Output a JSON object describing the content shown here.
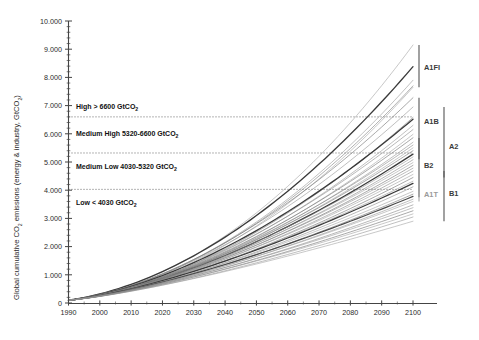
{
  "chart_data": {
    "type": "line",
    "title": "",
    "xlabel": "",
    "ylabel": "Global cumulative CO2 emissions (energy & industry, GtCO2)",
    "ylabel_parts": {
      "pre": "Global cumulative CO",
      "sub1": "2",
      "mid": " emissions (energy & industry, GtCO",
      "sub2": "2",
      "post": ")"
    },
    "xlim": [
      1990,
      2100
    ],
    "ylim": [
      0,
      10000
    ],
    "x_ticks": [
      1990,
      2000,
      2010,
      2020,
      2030,
      2040,
      2050,
      2060,
      2070,
      2080,
      2090,
      2100
    ],
    "x_tick_labels": [
      "1990",
      "2000",
      "2010",
      "2020",
      "2030",
      "2040",
      "2050",
      "2060",
      "2070",
      "2080",
      "2090",
      "2100"
    ],
    "y_ticks": [
      0,
      1000,
      2000,
      3000,
      4000,
      5000,
      6000,
      7000,
      8000,
      9000,
      10000
    ],
    "y_tick_labels": [
      "0",
      "1.000",
      "2.000",
      "3.000",
      "4.000",
      "5.000",
      "6.000",
      "7.000",
      "8.000",
      "9.000",
      "10.000"
    ],
    "y_minor_tick_step": 200,
    "grid": false,
    "legend": "right-brackets",
    "threshold_lines": [
      {
        "value": 6600,
        "style": "dotted"
      },
      {
        "value": 5320,
        "style": "dotted"
      },
      {
        "value": 4030,
        "style": "dotted"
      }
    ],
    "bands": [
      {
        "name": "High",
        "label": "High > 6600 GtCO",
        "sub": "2",
        "range": [
          6600,
          10000
        ],
        "text_y": 6950
      },
      {
        "name": "Medium High",
        "label": "Medium High 5320-6600 GtCO",
        "sub": "2",
        "range": [
          5320,
          6600
        ],
        "text_y": 5960
      },
      {
        "name": "Medium Low",
        "label": "Medium Low 4030-5320 GtCO",
        "sub": "2",
        "range": [
          4030,
          5320
        ],
        "text_y": 4800
      },
      {
        "name": "Low",
        "label": "Low < 4030 GtCO",
        "sub": "2",
        "range": [
          0,
          4030
        ],
        "text_y": 3530
      }
    ],
    "scenario_families": [
      {
        "label": "A1FI",
        "column": 1,
        "range_2100": [
          7650,
          9150
        ],
        "label_y": 8350,
        "color": "#555555"
      },
      {
        "label": "A1B",
        "column": 1,
        "range_2100": [
          5100,
          7280
        ],
        "label_y": 6450,
        "color": "#555555"
      },
      {
        "label": "B2",
        "column": 1,
        "range_2100": [
          3750,
          5850
        ],
        "label_y": 4860,
        "color": "#555555"
      },
      {
        "label": "A1T",
        "column": 1,
        "range_2100": [
          3600,
          3960
        ],
        "label_y": 3840,
        "color": "#aaaaaa"
      },
      {
        "label": "A2",
        "column": 2,
        "range_2100": [
          4450,
          6950
        ],
        "label_y": 5560,
        "color": "#555555"
      },
      {
        "label": "B1",
        "column": 2,
        "range_2100": [
          2900,
          4680
        ],
        "label_y": 3870,
        "color": "#555555"
      }
    ],
    "series": [
      {
        "name": "A1FI-1",
        "end_2100": 9150,
        "curve": 0.9,
        "w": 0.55,
        "c": "#9a9a9a"
      },
      {
        "name": "A1FI-2",
        "end_2100": 8380,
        "curve": 0.78,
        "w": 1.35,
        "c": "#3a3a3a"
      },
      {
        "name": "A1FI-3",
        "end_2100": 7900,
        "curve": 0.82,
        "w": 0.55,
        "c": "#8d8d8d"
      },
      {
        "name": "A1FI-4",
        "end_2100": 7700,
        "curve": 0.8,
        "w": 0.6,
        "c": "#7d7d7d"
      },
      {
        "name": "A1FI-5",
        "end_2100": 7650,
        "curve": 0.86,
        "w": 0.55,
        "c": "#9a9a9a"
      },
      {
        "name": "A2-1",
        "end_2100": 7280,
        "curve": 0.7,
        "w": 0.6,
        "c": "#6e6e6e"
      },
      {
        "name": "A2-2",
        "end_2100": 6950,
        "curve": 0.68,
        "w": 0.55,
        "c": "#8a8a8a"
      },
      {
        "name": "A1B-1",
        "end_2100": 6580,
        "curve": 0.72,
        "w": 0.6,
        "c": "#7a7a7a"
      },
      {
        "name": "A1B-2",
        "end_2100": 6520,
        "curve": 0.66,
        "w": 1.3,
        "c": "#3a3a3a"
      },
      {
        "name": "A1B-3",
        "end_2100": 6300,
        "curve": 0.7,
        "w": 0.55,
        "c": "#8d8d8d"
      },
      {
        "name": "A1B-4",
        "end_2100": 6150,
        "curve": 0.64,
        "w": 0.55,
        "c": "#7d7d7d"
      },
      {
        "name": "A1B-5",
        "end_2100": 5980,
        "curve": 0.68,
        "w": 0.55,
        "c": "#9a9a9a"
      },
      {
        "name": "A1B-6",
        "end_2100": 5860,
        "curve": 0.62,
        "w": 0.6,
        "c": "#6e6e6e"
      },
      {
        "name": "B2-1",
        "end_2100": 5700,
        "curve": 0.64,
        "w": 0.55,
        "c": "#8a8a8a"
      },
      {
        "name": "B2-2",
        "end_2100": 5600,
        "curve": 0.58,
        "w": 0.55,
        "c": "#7d7d7d"
      },
      {
        "name": "B2-3",
        "end_2100": 5500,
        "curve": 0.6,
        "w": 0.55,
        "c": "#9a9a9a"
      },
      {
        "name": "B2-4",
        "end_2100": 5400,
        "curve": 0.56,
        "w": 0.6,
        "c": "#6e6e6e"
      },
      {
        "name": "B2-5",
        "end_2100": 5280,
        "curve": 0.58,
        "w": 1.3,
        "c": "#3a3a3a"
      },
      {
        "name": "B2-6",
        "end_2100": 5180,
        "curve": 0.54,
        "w": 0.55,
        "c": "#8d8d8d"
      },
      {
        "name": "B2-7",
        "end_2100": 5080,
        "curve": 0.56,
        "w": 0.55,
        "c": "#7d7d7d"
      },
      {
        "name": "A2-3",
        "end_2100": 4980,
        "curve": 0.52,
        "w": 0.55,
        "c": "#9a9a9a"
      },
      {
        "name": "A2-4",
        "end_2100": 4880,
        "curve": 0.54,
        "w": 0.6,
        "c": "#6e6e6e"
      },
      {
        "name": "A2-5",
        "end_2100": 4780,
        "curve": 0.5,
        "w": 0.55,
        "c": "#8a8a8a"
      },
      {
        "name": "A2-6",
        "end_2100": 4680,
        "curve": 0.52,
        "w": 0.55,
        "c": "#7d7d7d"
      },
      {
        "name": "A2-7",
        "end_2100": 4560,
        "curve": 0.48,
        "w": 0.55,
        "c": "#9a9a9a"
      },
      {
        "name": "A2-8",
        "end_2100": 4450,
        "curve": 0.5,
        "w": 0.6,
        "c": "#6e6e6e"
      },
      {
        "name": "B1-1",
        "end_2100": 4320,
        "curve": 0.46,
        "w": 0.55,
        "c": "#8d8d8d"
      },
      {
        "name": "B1-2",
        "end_2100": 4240,
        "curve": 0.44,
        "w": 1.25,
        "c": "#3a3a3a"
      },
      {
        "name": "B1-3",
        "end_2100": 4120,
        "curve": 0.46,
        "w": 0.55,
        "c": "#7d7d7d"
      },
      {
        "name": "B1-4",
        "end_2100": 3960,
        "curve": 0.42,
        "w": 0.55,
        "c": "#9a9a9a"
      },
      {
        "name": "A1T-1",
        "end_2100": 3860,
        "curve": 0.44,
        "w": 0.6,
        "c": "#6e6e6e"
      },
      {
        "name": "A1T-2",
        "end_2100": 3780,
        "curve": 0.4,
        "w": 1.2,
        "c": "#4a4a4a"
      },
      {
        "name": "A1T-3",
        "end_2100": 3680,
        "curve": 0.42,
        "w": 0.55,
        "c": "#8a8a8a"
      },
      {
        "name": "A1T-4",
        "end_2100": 3600,
        "curve": 0.38,
        "w": 0.55,
        "c": "#9a9a9a"
      },
      {
        "name": "B1-5",
        "end_2100": 3480,
        "curve": 0.4,
        "w": 0.55,
        "c": "#7d7d7d"
      },
      {
        "name": "B1-6",
        "end_2100": 3380,
        "curve": 0.36,
        "w": 0.55,
        "c": "#8d8d8d"
      },
      {
        "name": "B1-7",
        "end_2100": 3270,
        "curve": 0.38,
        "w": 0.6,
        "c": "#6e6e6e"
      },
      {
        "name": "B1-8",
        "end_2100": 3160,
        "curve": 0.34,
        "w": 0.55,
        "c": "#9a9a9a"
      },
      {
        "name": "B1-9",
        "end_2100": 3050,
        "curve": 0.36,
        "w": 0.55,
        "c": "#8a8a8a"
      },
      {
        "name": "B1-10",
        "end_2100": 2900,
        "curve": 0.32,
        "w": 0.55,
        "c": "#9a9a9a"
      }
    ]
  }
}
